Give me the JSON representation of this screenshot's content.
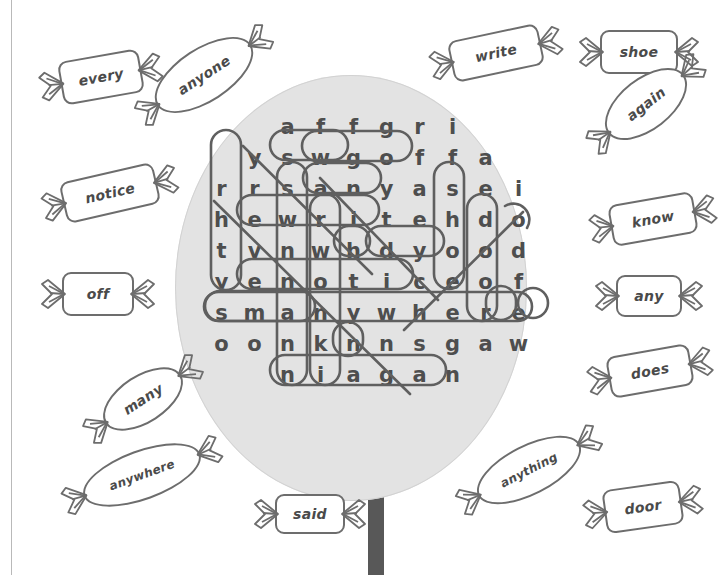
{
  "page": {
    "type": "word-search-puzzle-worksheet",
    "theme": "lollipop-and-candies",
    "colors": {
      "lollipop_disc": "#e3e3e3",
      "lollipop_stick": "#585858",
      "letter": "#4e4e4e",
      "ring_outline": "#5f5f5f",
      "candy_outline": "#6d6d6d",
      "paper": "#ffffff"
    }
  },
  "puzzle": {
    "title": "",
    "rows": 9,
    "cols": 10,
    "grid": [
      {
        "indent": 2,
        "letters": [
          "a",
          "f",
          "f",
          "g",
          "r",
          "i"
        ]
      },
      {
        "indent": 1,
        "letters": [
          "y",
          "s",
          "w",
          "g",
          "o",
          "f",
          "f",
          "a"
        ]
      },
      {
        "indent": 0,
        "letters": [
          "r",
          "r",
          "s",
          "a",
          "n",
          "y",
          "a",
          "s",
          "e",
          "i"
        ]
      },
      {
        "indent": 0,
        "letters": [
          "h",
          "e",
          "w",
          "r",
          "i",
          "t",
          "e",
          "h",
          "d",
          "o"
        ]
      },
      {
        "indent": 0,
        "letters": [
          "t",
          "v",
          "n",
          "w",
          "h",
          "d",
          "y",
          "o",
          "o",
          "d"
        ]
      },
      {
        "indent": 0,
        "letters": [
          "y",
          "e",
          "n",
          "o",
          "t",
          "i",
          "c",
          "e",
          "o",
          "f"
        ]
      },
      {
        "indent": 0,
        "letters": [
          "s",
          "m",
          "a",
          "n",
          "y",
          "w",
          "h",
          "e",
          "r",
          "e"
        ]
      },
      {
        "indent": 0,
        "letters": [
          "o",
          "o",
          "n",
          "k",
          "n",
          "n",
          "s",
          "g",
          "a",
          "w"
        ]
      },
      {
        "indent": 2,
        "letters": [
          "n",
          "i",
          "a",
          "g",
          "a",
          "n"
        ]
      }
    ],
    "found_words": [
      "off",
      "any",
      "write",
      "notice",
      "many",
      "anywhere",
      "shoe",
      "door",
      "again",
      "every",
      "anyone",
      "anything",
      "know",
      "does",
      "said"
    ]
  },
  "word_bank": {
    "label": "",
    "candies": [
      {
        "word": "every",
        "shape": "rect"
      },
      {
        "word": "anyone",
        "shape": "oval"
      },
      {
        "word": "write",
        "shape": "rect"
      },
      {
        "word": "shoe",
        "shape": "rect"
      },
      {
        "word": "again",
        "shape": "oval"
      },
      {
        "word": "notice",
        "shape": "rect"
      },
      {
        "word": "know",
        "shape": "rect"
      },
      {
        "word": "off",
        "shape": "rect"
      },
      {
        "word": "any",
        "shape": "rect"
      },
      {
        "word": "many",
        "shape": "oval"
      },
      {
        "word": "does",
        "shape": "rect"
      },
      {
        "word": "anywhere",
        "shape": "oval"
      },
      {
        "word": "said",
        "shape": "rect"
      },
      {
        "word": "anything",
        "shape": "oval"
      },
      {
        "word": "door",
        "shape": "rect"
      }
    ]
  }
}
